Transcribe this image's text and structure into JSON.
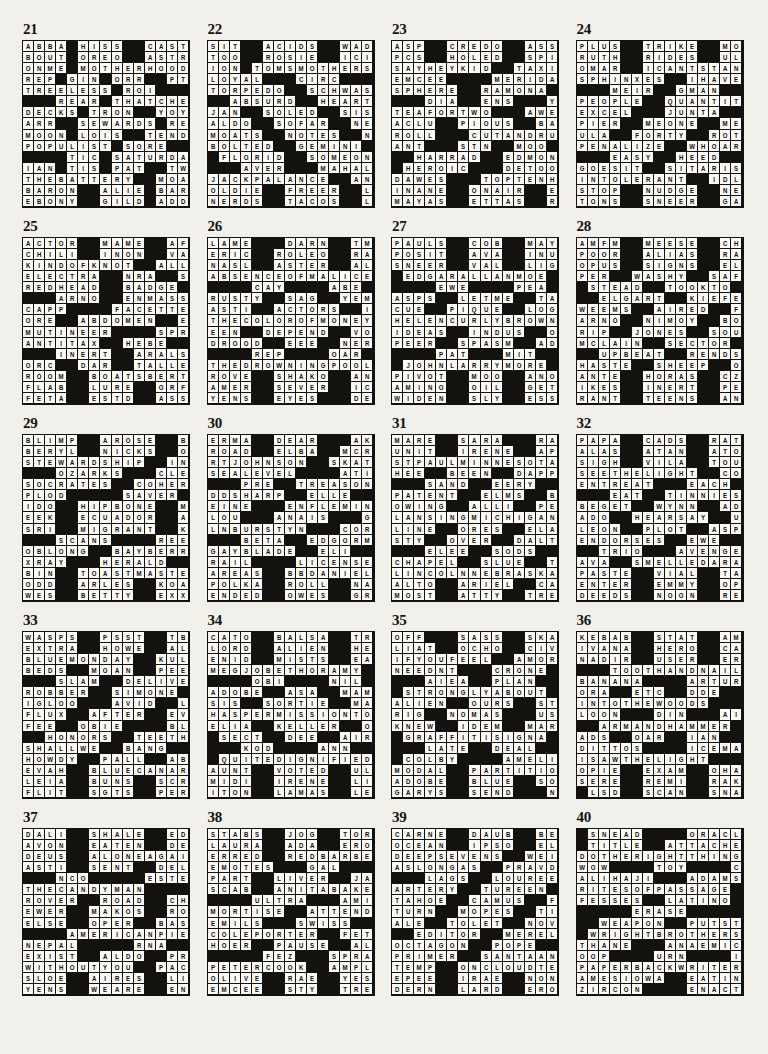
{
  "page": {
    "type": "crossword-answer-key",
    "columns": 4,
    "rows": 5,
    "grid_size": 15,
    "block_char": "#"
  },
  "puzzles": [
    {
      "number": "21",
      "grid": [
        "ABBA#HISS##CASTS",
        "BOUT#OREO##ASTRO",
        "ONME#MOTHERHOOD",
        "REP#GIN#ORR##PTA",
        "TREELESS#ROI####",
        "###REAR#THATCHER",
        "DECKS#TRON##YOYO",
        "ARR##SEWARDS#RED",
        "MOON#LOIS##TENDS",
        "POPULIST#SORE###",
        "####TIC#SATURDAY",
        "IAN#TIS#PAT##TWA",
        "THEBATTERY#MOAN",
        "BARON##ALIE#BARK",
        "EBONY##GILD#ADDS"
      ],
      "rows_raw": [
        [
          "A",
          "B",
          "B",
          "A",
          "#",
          "H",
          "I",
          "S",
          "S",
          "#",
          "#",
          "C",
          "A",
          "S",
          "T",
          "S"
        ],
        [
          "B",
          "O",
          "U",
          "T",
          "#",
          "O",
          "R",
          "E",
          "O",
          "#",
          "#",
          "A",
          "S",
          "T",
          "R",
          "O"
        ]
      ]
    },
    {
      "number": "22"
    },
    {
      "number": "23"
    },
    {
      "number": "24"
    },
    {
      "number": "25"
    },
    {
      "number": "26"
    },
    {
      "number": "27"
    },
    {
      "number": "28"
    },
    {
      "number": "29"
    },
    {
      "number": "30"
    },
    {
      "number": "31"
    },
    {
      "number": "32"
    },
    {
      "number": "33"
    },
    {
      "number": "34"
    },
    {
      "number": "35"
    },
    {
      "number": "36"
    },
    {
      "number": "37"
    },
    {
      "number": "38"
    },
    {
      "number": "39"
    },
    {
      "number": "40"
    }
  ],
  "grids": {
    "21": [
      "ABBA#HISS##CASTS",
      "BOUT#OREO##ASTRO",
      "ONME#MOTHERHOOD#",
      "REP#GIN#ORR##PTA",
      "TREELESS#ROI####",
      "###REAR#THATCHER",
      "DECKS#TRON##YOYO",
      "ARR##SEWARDS#RED",
      "MOON#LOIS##TENDS",
      "POPULIST#SORE###",
      "####TIC#SATURDAY",
      "IAN#TIS#PAT##TWA",
      "THEBATTERY##MOAN",
      "BARON##ALIE#BARK",
      "EBONY##GILD#ADDS"
    ],
    "22": [
      "SIT##ACIDS##WADED",
      "TOO##ROSIE##ICIER",
      "ION#TOMSMOTHERS",
      "LOYAL###CIRC####",
      "TORPEDO##SCHWAS#",
      "##ABSURD##HEARTS",
      "JAN##SOLED##SISAL",
      "ALDO##SOFAR##NERO",
      "MOATS##NOTES##NEW",
      "BOLTED##GEMINI##",
      "#FLORID##SOMEONE",
      "###AVER###MAHAL",
      "JACKPALANCE##ANI",
      "OLDIE##FREER##LCD",
      "NERDS##TACOS##LYE"
    ],
    "23": [
      "ASP##CREDO##ASSAY",
      "PCS##HOLED##SPIRE",
      "SAYHEYKID##TAXIS",
      "EMCEE####MERIDA#",
      "SPHERE##RAMONA##",
      "###DIA##ENS###YMA",
      "TEAFORTWO###AWED",
      "ACLU##PIOUS##BANE",
      "ROLL###CUTANDRUN",
      "ANT###STN##MOO###",
      "##HARRAD##EDMOND",
      "#HEROIC###DETOO",
      "DAWES###TOPTENHIT",
      "INANE##ONAIR##ESE",
      "MAYAS##ETTAS##RED"
    ],
    "24": [
      "PLUS##TRIKE##MOAN",
      "RUTH##RIDES##ULNA",
      "OMAR##ICANTSTAND",
      "SPHINXES##IHAVEA",
      "###MEIR##GMAN###",
      "PEOPLE##QUANTITY",
      "EXCEL###JUNTA##GEO",
      "PIER##MEONE##MENU",
      "ULA##FORTY##ROTOR",
      "PENALIZE##WHOARE",
      "###EASY##HEED####",
      "GOESIT##SITARIST",
      "INTOLERANT##IDLY",
      "STOP##NUDGE##NEON",
      "TONS##SNEER##GABE"
    ],
    "25": [
      "ACTOR##MAME##AFRO",
      "CHILI##INON##VAIN",
      "KINDOFKNOT##ALLY",
      "ELECTRA##NRA##SEX",
      "REDHEAD##BADGE##",
      "###ARNO##ENMASSE",
      "CAPP####FACETTED",
      "ORE##ABDOMEN##EEG",
      "MUTINEER####SPRY",
      "ANTITAX##HEBE###",
      "###INERT##ARALSEA",
      "ORC##DAR##TALLEST",
      "ROOM##BOATSBERTH",
      "FLAB##LURE##ORFEO",
      "FETA##ESTD##ASSES"
    ],
    "26": [
      "LAME###DARN##TMAN",
      "ERIC##ROLEO##RAVI",
      "NASL##ASTER##ALEC",
      "ABSENCEOFMALICE",
      "####CAY####ABE###",
      "RUSTY##SAG##YEMEN",
      "ASTI##ACTORS##ILO",
      "THECOLOROFMONEY",
      "EEN##DEPEND##VOCE",
      "DROOD##EEE##NERTS",
      "####REP####OAR###",
      "THEDROWNINGPOOL",
      "ROVE##SHAKO##ANNA",
      "AMER##SEVER##ICER",
      "YENS##EYES###DESK"
    ],
    "27": [
      "PAULS##COB##MAYAN",
      "POSIT##AVA##INUSE",
      "SNEER##VAL##LIGHT",
      "#EDGARALLANMOE#",
      "####EWE####PEA###",
      "ASPS##LETME##TATA",
      "CUE##PIQUE##LOGON",
      "HELENCURLYBROWN",
      "IDEAS##INDUS##ONE",
      "PEER##SPASM##ADES",
      "####PAT###MIT####",
      "#JOHNLARRYMORE#",
      "PIVOT##MOO##ANODE",
      "AMINO##OIL##GETGO",
      "WIDEN##SLY##ESSES"
    ],
    "28": [
      "AMFM##MEESE##CHAP",
      "POOR##ALIAS##RABE",
      "OPUS##SIGNS##ELLA",
      "PER##WASHY##SAFER",
      "#STEAD##TOOKTO##",
      "##ELGART##KIEFER",
      "WEEMS##AIRED##FOO",
      "ARNO##NIMOY##BONN",
      "RIP##JONES##SOUSA",
      "MCLAIN##SECTOR##",
      "##UPBEAT##RENDS#",
      "HASTE##SHEEP##OCT",
      "ANTE##HORAS##CZAR",
      "IKES##INERT##PELE",
      "RANT##TEENS##ANDY"
    ],
    "29": [
      "BLIMP##AROSE##BOP",
      "BERYL##NICKS##OWE",
      "STEWARDSHIP##INK",
      "###OZARKS###CLEO",
      "SOCRATES##COHERE",
      "PLOD#####SAVER##",
      "IDO##HIPBONE##MSG",
      "EEK##ECUADOR##AHA",
      "SRI##MIGRANT##KEW",
      "###SCANS####REEK",
      "OBLONG##BAYBERRY",
      "XRAY###HERALD###",
      "BIN##TOASTMASTER",
      "ODD##ARLES##KOALA",
      "WES##BETTY##EXXON"
    ],
    "30": [
      "ERMA##DEAR###AKEEM",
      "ROAD##ELBA##MCRAE",
      "RTJOHNSON##SKATE",
      "SEALEVEL####ATIT",
      "###PRE##TREASONS",
      "DDSHARP##ELLE###",
      "EINE###ENFLEMING",
      "LOU###ANAIS###GOO",
      "LNBURSTYN###CORN",
      "###BETA##EDGORME",
      "GAYBLADE##ELI###",
      "RAIL####LICENSEE",
      "AREAS##BBDANIELS",
      "POLKA##ROLL##NASA",
      "ENDED##OWES##GRAU"
    ],
    "31": [
      "MARE##SARA###RAMP",
      "UNIT##IRENE##APIE",
      "STPAULMINNESOTA",
      "HEE##BEEN##DAPPER",
      "###SAND##EERY####",
      "PATENT##ELMS##BEL",
      "OWING##ALLI##PERI",
      "LANSINGMICHIGAN",
      "LINE##ORES##ELATE",
      "STY##OVER##DALTON",
      "###ELEE##SODS####",
      "CHAPEL##SLUE##TOY",
      "LINCOLNNEBRASKA",
      "ALTO##ARIEL##CAIN",
      "MOST##ATTY##TREK"
    ],
    "32": [
      "PAPA##CADS##RATON",
      "ALAS##ATAN##ATONE",
      "SIGH##VILA##TOUTS",
      "SEETHELIGHT##COT",
      "ENTREAT###EACH##",
      "###EAT##TINNIEST",
      "BEGET##WYNN##ADAM",
      "ADO##HEARSAY##UKE",
      "LEON##PLOT##ASPEN",
      "ENDORSES##EWE###",
      "##TRIO###AVENGES",
      "AVA##SMELLEDARAT",
      "PASTE##VIAL##TARA",
      "ENTER##EMMY##OPEN",
      "DEEDS##NOON##REDD"
    ],
    "33": [
      "WASPS##PSST##TBSP",
      "EXTRA##HOWE##ALAI",
      "BLUEMONDAY##KULP",
      "BEDS##MOAN##PEEVE",
      "###SLAM##DELIVER",
      "ROBBER##SIMONE##",
      "IGLOO###AVID##LYE",
      "FLUX##AFTER##EVEL",
      "FEE##OBIE####BLEAK",
      "##HONORS##TEETHE",
      "SHALLWE##BANG###",
      "HOWDY##PALL##ABUT",
      "EVAH##BLUECANARY",
      "LEIA##BUNS##SCRIP",
      "FLIT##SGTS##PERSE"
    ],
    "34": [
      "CATO##BALSA##TRAY",
      "LORD##ALIEN##HERE",
      "ENID##MISTS##EATS",
      "MEGJOBETHORAMY#",
      "####OBI####NIL###",
      "ADOBE##ASA##MAMA",
      "SIS##SORTIE##MASH",
      "HASPERMISSIONTO",
      "ELIA##KELLER##OHO",
      "#SECT##DEE##AIRED",
      "###KOD####ANN####",
      "#QUITEDIGNIFIED",
      "AUNT##VOTED##ULNA",
      "MIDI##IRENE##LION",
      "ITON##LAMAS##LESS"
    ],
    "35": [
      "OFF###SASS##SKATE",
      "LIAT##OCHO##CIVIL",
      "IFYOUFEEL##AMORY",
      "NEEDNT###CRONE##",
      "###AIEA##PLAN####",
      "#STRONGLYABOUT#",
      "ALIEN##OURS##STOW",
      "RIG##NOMAS###USH",
      "KNEW##IDEM##MARCO",
      "#GRAFFITISIGNA#",
      "###LATE##DEAL####",
      "#COLBY####AMELIA",
      "MODAL##PARTITION",
      "ADOBE##BLUE##SOLD",
      "GARYS##SEND###NAY"
    ],
    "36": [
      "KEBAB##STAT##AMA#",
      "IVANA##HERO##CADS",
      "NADIR##USER##ERMA",
      "###TOOTHANDNAIL",
      "BANANA####ARTURO",
      "ORA##ETC##DDE##DEN",
      "INTOTHEWOODS###",
      "LOON###DIN###AIDE",
      "##ARMANDHAMMER",
      "ADS##OAR##IAN##ALI",
      "DITTOS####ICEMAN",
      "ISAWTHELIGHT###",
      "OPIE##EXAM##OHARA",
      "SERE##REMI##RAKES",
      "#LSD##SCAN##SNACK"
    ],
    "37": [
      "DALI##SHALE##EDAM",
      "AVON##EATEN##DELI",
      "DEUS##ALONEAGAIN",
      "ASTI##SENT##DELVE",
      "###NCO#####ESTER",
      "THECANDYMAN#####",
      "ROVER##ROAD##CHAD",
      "EWER##MAKOS##ROLE",
      "ELSE##OPER##BASIL",
      "####AMERICANPIE",
      "NEPAL#####RNA###",
      "EXIST##ALDO##PRIM",
      "WITHOUTYOU##PACE",
      "SLOE##AIRES##LIEN",
      "YENS##WEARE##ENDS"
    ],
    "38": [
      "STABS##JOG##TORAH",
      "LAURA##ADA##ERODE",
      "ERRED##REDBARBER",
      "EMOTES###GAL####",
      "PART##LIVER##JAMB",
      "SCAB##ANITABAKER",
      "####ULTRA###AMINO",
      "MORTISE##ATTENDS",
      "EMILS###SWISS###",
      "COLEPORTER##FETA",
      "HOER##PAUSE##ALIS",
      "#####FEZ###SPRATS",
      "PETERCOOK##AMPLE",
      "OLIVE##RAE##YESES",
      "EMCEE##STY##TRESS"
    ],
    "39": [
      "CARNE##DAUB##BEEF",
      "OCEAN##IPSO##ELLA",
      "DEEPSEVENS##WEIR",
      "ASLONGAS##PRAVDA",
      "###LAGS##LOUREED",
      "ARTERY##TUREEN##",
      "TAHOE##CAMUS##FOR",
      "TURN##MOPES##TIRE",
      "ALE##TOLET##NOVEL",
      "##EDITOR##MERELY",
      "OCTAGON##POPE###",
      "PRIMER##SANTAANA",
      "TEMP##ONCLOUDTEN",
      "EPEE##IRAE##NONET",
      "DERN##LARD##ERODE"
    ],
    "40": [
      "#SNEAD####ORACLE",
      "#TITLE##ATTACHED",
      "DOTHERIGHTTHING",
      "WOW####TOY####CDE",
      "ALIHAJI###ADAMS",
      "RITESOFPASSAGE#",
      "FESSES##LATINO##",
      "#####ERASE#####",
      "##WEAPON##PUTSTO",
      "#WRIGHTBROTHERS",
      "THANE###ANAEMIC",
      "OOP####URN####IDA",
      "PAPERBACKWRITER",
      "AMESIOWA##EATIN",
      "ZIRCON####ENACT#"
    ]
  }
}
